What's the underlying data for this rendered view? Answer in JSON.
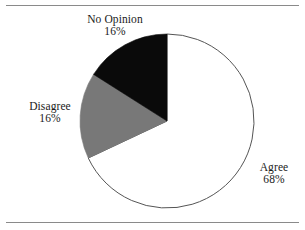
{
  "figure": {
    "background_color": "#ffffff",
    "rule_color": "#8a8a8a",
    "has_top_rule": true,
    "has_bottom_rule": true
  },
  "chart_data": {
    "type": "pie",
    "title": "",
    "subtitle": "",
    "xlabel": "",
    "ylabel": "",
    "legend_position": "none",
    "grid": false,
    "labels_outside": true,
    "start_angle_deg": 90,
    "direction": "counterclockwise",
    "center": {
      "x": 167,
      "y": 121
    },
    "radius": 87,
    "categories": [
      "Agree",
      "No Opinion",
      "Disagree"
    ],
    "values": [
      68,
      16,
      16
    ],
    "unit": "%",
    "slices": [
      {
        "name": "Agree",
        "label": "Agree",
        "value": 68,
        "value_label": "68%",
        "color": "#ffffff",
        "edge_color": "#555555",
        "label_position": "right"
      },
      {
        "name": "No Opinion",
        "label": "No Opinion",
        "value": 16,
        "value_label": "16%",
        "color": "#0a0a0a",
        "edge_color": "#0a0a0a",
        "label_position": "top"
      },
      {
        "name": "Disagree",
        "label": "Disagree",
        "value": 16,
        "value_label": "16%",
        "color": "#787878",
        "edge_color": "#787878",
        "label_position": "left"
      }
    ]
  }
}
